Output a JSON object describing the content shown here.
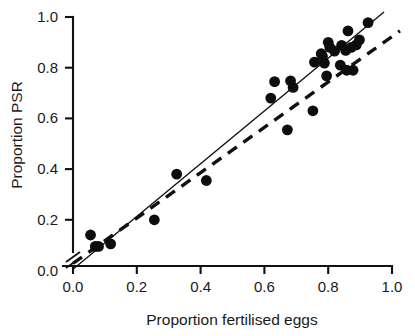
{
  "chart_data": {
    "type": "scatter",
    "title": "",
    "xlabel": "Proportion fertilised eggs",
    "ylabel": "Proportion PSR",
    "xlim": [
      0.0,
      1.0
    ],
    "ylim": [
      0.0,
      1.0
    ],
    "grid": false,
    "legend": "none",
    "x_ticks": [
      "0.0",
      "0.2",
      "0.4",
      "0.6",
      "0.8",
      "1.0"
    ],
    "x_tick_values": [
      0.0,
      0.2,
      0.4,
      0.6,
      0.8,
      1.0
    ],
    "y_ticks": [
      "0.0",
      "0.2",
      "0.4",
      "0.6",
      "0.8",
      "1.0"
    ],
    "y_tick_values": [
      0.0,
      0.2,
      0.4,
      0.6,
      0.8,
      1.0
    ],
    "axis_break": true,
    "marker": "filled-circle",
    "marker_color": "#0d0d0d",
    "points": [
      {
        "x": 0.055,
        "y": 0.14
      },
      {
        "x": 0.07,
        "y": 0.095
      },
      {
        "x": 0.08,
        "y": 0.095
      },
      {
        "x": 0.118,
        "y": 0.105
      },
      {
        "x": 0.255,
        "y": 0.2
      },
      {
        "x": 0.325,
        "y": 0.38
      },
      {
        "x": 0.418,
        "y": 0.355
      },
      {
        "x": 0.62,
        "y": 0.68
      },
      {
        "x": 0.632,
        "y": 0.745
      },
      {
        "x": 0.672,
        "y": 0.555
      },
      {
        "x": 0.682,
        "y": 0.748
      },
      {
        "x": 0.69,
        "y": 0.722
      },
      {
        "x": 0.752,
        "y": 0.63
      },
      {
        "x": 0.757,
        "y": 0.822
      },
      {
        "x": 0.778,
        "y": 0.855
      },
      {
        "x": 0.782,
        "y": 0.845
      },
      {
        "x": 0.788,
        "y": 0.818
      },
      {
        "x": 0.795,
        "y": 0.768
      },
      {
        "x": 0.8,
        "y": 0.9
      },
      {
        "x": 0.805,
        "y": 0.88
      },
      {
        "x": 0.82,
        "y": 0.865
      },
      {
        "x": 0.838,
        "y": 0.81
      },
      {
        "x": 0.842,
        "y": 0.888
      },
      {
        "x": 0.855,
        "y": 0.868
      },
      {
        "x": 0.858,
        "y": 0.79
      },
      {
        "x": 0.862,
        "y": 0.945
      },
      {
        "x": 0.872,
        "y": 0.88
      },
      {
        "x": 0.878,
        "y": 0.79
      },
      {
        "x": 0.888,
        "y": 0.89
      },
      {
        "x": 0.898,
        "y": 0.91
      },
      {
        "x": 0.925,
        "y": 0.978
      }
    ],
    "lines": [
      {
        "name": "regression-line",
        "style": "solid",
        "x_start": 0.0,
        "y_start": 0.005,
        "x_end": 0.975,
        "y_end": 1.02
      },
      {
        "name": "reference-line",
        "style": "dashed",
        "x_start": 0.0,
        "y_start": 0.028,
        "x_end": 1.025,
        "y_end": 0.945
      }
    ]
  },
  "axes": {
    "x_title": "Proportion fertilised eggs",
    "y_title": "Proportion PSR"
  }
}
